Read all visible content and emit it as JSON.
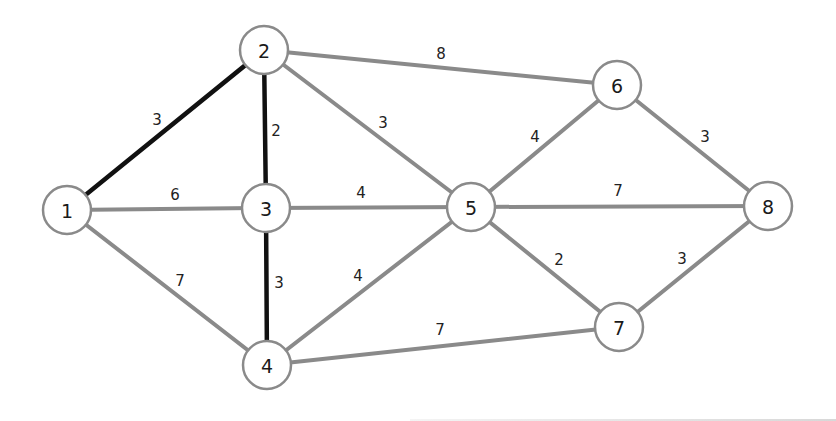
{
  "diagram": {
    "type": "weighted-undirected-graph",
    "nodes": [
      {
        "id": "1",
        "label": "1",
        "x": 67,
        "y": 210
      },
      {
        "id": "2",
        "label": "2",
        "x": 264,
        "y": 50
      },
      {
        "id": "3",
        "label": "3",
        "x": 266,
        "y": 208
      },
      {
        "id": "4",
        "label": "4",
        "x": 267,
        "y": 365
      },
      {
        "id": "5",
        "label": "5",
        "x": 471,
        "y": 207
      },
      {
        "id": "6",
        "label": "6",
        "x": 617,
        "y": 85
      },
      {
        "id": "7",
        "label": "7",
        "x": 619,
        "y": 327
      },
      {
        "id": "8",
        "label": "8",
        "x": 768,
        "y": 206
      }
    ],
    "edges": [
      {
        "from": "1",
        "to": "2",
        "weight": "3",
        "highlighted": true,
        "lx": 157,
        "ly": 120
      },
      {
        "from": "1",
        "to": "3",
        "weight": "6",
        "highlighted": false,
        "lx": 175,
        "ly": 195
      },
      {
        "from": "1",
        "to": "4",
        "weight": "7",
        "highlighted": false,
        "lx": 180,
        "ly": 281
      },
      {
        "from": "2",
        "to": "3",
        "weight": "2",
        "highlighted": true,
        "lx": 276,
        "ly": 131
      },
      {
        "from": "2",
        "to": "5",
        "weight": "3",
        "highlighted": false,
        "lx": 383,
        "ly": 123
      },
      {
        "from": "2",
        "to": "6",
        "weight": "8",
        "highlighted": false,
        "lx": 441,
        "ly": 54
      },
      {
        "from": "3",
        "to": "4",
        "weight": "3",
        "highlighted": true,
        "lx": 279,
        "ly": 283
      },
      {
        "from": "3",
        "to": "5",
        "weight": "4",
        "highlighted": false,
        "lx": 361,
        "ly": 193
      },
      {
        "from": "4",
        "to": "5",
        "weight": "4",
        "highlighted": false,
        "lx": 358,
        "ly": 276
      },
      {
        "from": "4",
        "to": "7",
        "weight": "7",
        "highlighted": false,
        "lx": 440,
        "ly": 330
      },
      {
        "from": "5",
        "to": "6",
        "weight": "4",
        "highlighted": false,
        "lx": 535,
        "ly": 137
      },
      {
        "from": "5",
        "to": "8",
        "weight": "7",
        "highlighted": false,
        "lx": 618,
        "ly": 191
      },
      {
        "from": "5",
        "to": "7",
        "weight": "2",
        "highlighted": false,
        "lx": 559,
        "ly": 260
      },
      {
        "from": "6",
        "to": "8",
        "weight": "3",
        "highlighted": false,
        "lx": 705,
        "ly": 137
      },
      {
        "from": "7",
        "to": "8",
        "weight": "3",
        "highlighted": false,
        "lx": 682,
        "ly": 259
      }
    ],
    "colors": {
      "edge": "#8a8a8a",
      "highlighted_edge": "#111111",
      "node_fill": "#ffffff",
      "node_stroke": "#8a8a8a"
    }
  }
}
